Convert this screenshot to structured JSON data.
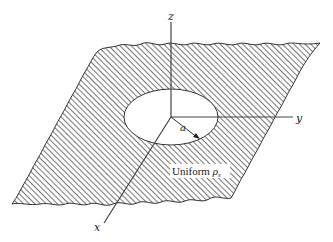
{
  "diagram": {
    "axes": {
      "z_label": "z",
      "y_label": "y",
      "x_label": "x"
    },
    "radius_label": "a",
    "region_label": {
      "text": "Uniform ",
      "symbol": "ρ",
      "subscript": "s"
    },
    "colors": {
      "hatch": "#555555",
      "outline": "#333333",
      "background": "#ffffff"
    }
  }
}
